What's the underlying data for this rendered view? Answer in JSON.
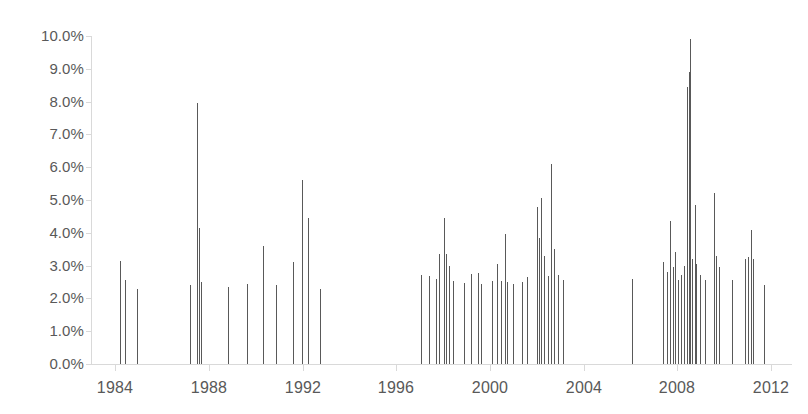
{
  "chart_data": {
    "type": "bar",
    "title": "",
    "subtitle": "",
    "xlabel": "",
    "ylabel": "",
    "xlim": [
      1983.0,
      2012.9
    ],
    "ylim": [
      0,
      0.1
    ],
    "grid": false,
    "legend": null,
    "y_tick_labels": [
      "10.0%",
      "9.0%",
      "8.0%",
      "7.0%",
      "6.0%",
      "5.0%",
      "4.0%",
      "3.0%",
      "2.0%",
      "1.0%",
      "0.0%"
    ],
    "y_tick_values": [
      10.0,
      9.0,
      8.0,
      7.0,
      6.0,
      5.0,
      4.0,
      3.0,
      2.0,
      1.0,
      0.0
    ],
    "x_tick_labels": [
      "1984",
      "1988",
      "1992",
      "1996",
      "2000",
      "2004",
      "2008",
      "2012"
    ],
    "x_tick_values": [
      1984,
      1988,
      1992,
      1996,
      2000,
      2004,
      2008,
      2012
    ],
    "bar_color": "#595959",
    "axis_color": "#d9d9d9",
    "units": "percent",
    "series": [
      {
        "name": "value",
        "points": [
          {
            "x": 1984.18,
            "y": 3.15
          },
          {
            "x": 1984.42,
            "y": 2.55
          },
          {
            "x": 1984.92,
            "y": 2.3
          },
          {
            "x": 1987.18,
            "y": 2.4
          },
          {
            "x": 1987.5,
            "y": 7.95
          },
          {
            "x": 1987.58,
            "y": 4.15
          },
          {
            "x": 1987.66,
            "y": 2.5
          },
          {
            "x": 1988.82,
            "y": 2.35
          },
          {
            "x": 1989.62,
            "y": 2.45
          },
          {
            "x": 1990.32,
            "y": 3.6
          },
          {
            "x": 1990.86,
            "y": 2.4
          },
          {
            "x": 1991.6,
            "y": 3.1
          },
          {
            "x": 1991.98,
            "y": 5.6
          },
          {
            "x": 1992.22,
            "y": 4.45
          },
          {
            "x": 1992.72,
            "y": 2.3
          },
          {
            "x": 1997.06,
            "y": 2.72
          },
          {
            "x": 1997.38,
            "y": 2.68
          },
          {
            "x": 1997.7,
            "y": 2.6
          },
          {
            "x": 1997.84,
            "y": 3.35
          },
          {
            "x": 1998.02,
            "y": 4.45
          },
          {
            "x": 1998.12,
            "y": 3.35
          },
          {
            "x": 1998.26,
            "y": 3.0
          },
          {
            "x": 1998.4,
            "y": 2.52
          },
          {
            "x": 1998.9,
            "y": 2.48
          },
          {
            "x": 1999.2,
            "y": 2.75
          },
          {
            "x": 1999.48,
            "y": 2.78
          },
          {
            "x": 1999.62,
            "y": 2.45
          },
          {
            "x": 2000.1,
            "y": 2.52
          },
          {
            "x": 2000.3,
            "y": 3.05
          },
          {
            "x": 2000.46,
            "y": 2.52
          },
          {
            "x": 2000.62,
            "y": 3.95
          },
          {
            "x": 2000.74,
            "y": 2.5
          },
          {
            "x": 2001.0,
            "y": 2.45
          },
          {
            "x": 2001.38,
            "y": 2.5
          },
          {
            "x": 2001.58,
            "y": 2.65
          },
          {
            "x": 2002.0,
            "y": 4.8
          },
          {
            "x": 2002.1,
            "y": 3.85
          },
          {
            "x": 2002.2,
            "y": 5.05
          },
          {
            "x": 2002.32,
            "y": 3.3
          },
          {
            "x": 2002.46,
            "y": 2.68
          },
          {
            "x": 2002.62,
            "y": 6.1
          },
          {
            "x": 2002.74,
            "y": 3.5
          },
          {
            "x": 2002.9,
            "y": 2.7
          },
          {
            "x": 2003.1,
            "y": 2.55
          },
          {
            "x": 2006.06,
            "y": 2.6
          },
          {
            "x": 2007.38,
            "y": 3.1
          },
          {
            "x": 2007.54,
            "y": 2.8
          },
          {
            "x": 2007.7,
            "y": 4.35
          },
          {
            "x": 2007.8,
            "y": 2.95
          },
          {
            "x": 2007.92,
            "y": 3.4
          },
          {
            "x": 2008.02,
            "y": 2.55
          },
          {
            "x": 2008.14,
            "y": 2.7
          },
          {
            "x": 2008.28,
            "y": 3.0
          },
          {
            "x": 2008.4,
            "y": 8.45
          },
          {
            "x": 2008.48,
            "y": 8.9
          },
          {
            "x": 2008.56,
            "y": 9.9
          },
          {
            "x": 2008.64,
            "y": 3.2
          },
          {
            "x": 2008.74,
            "y": 4.85
          },
          {
            "x": 2008.82,
            "y": 3.05
          },
          {
            "x": 2008.96,
            "y": 2.7
          },
          {
            "x": 2009.2,
            "y": 2.55
          },
          {
            "x": 2009.56,
            "y": 5.2
          },
          {
            "x": 2009.66,
            "y": 3.3
          },
          {
            "x": 2009.78,
            "y": 2.95
          },
          {
            "x": 2010.34,
            "y": 2.55
          },
          {
            "x": 2010.88,
            "y": 3.2
          },
          {
            "x": 2011.0,
            "y": 3.25
          },
          {
            "x": 2011.14,
            "y": 4.1
          },
          {
            "x": 2011.24,
            "y": 3.2
          },
          {
            "x": 2011.7,
            "y": 2.4
          }
        ]
      }
    ]
  }
}
